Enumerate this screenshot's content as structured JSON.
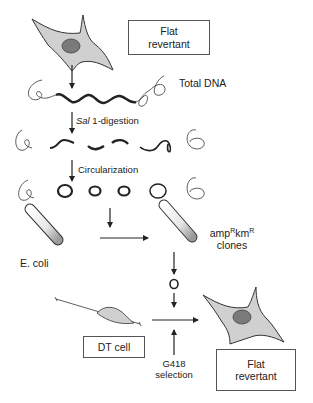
{
  "diagram": {
    "top_box": {
      "line1": "Flat",
      "line2": "revertant"
    },
    "labels": {
      "total_dna": "Total DNA",
      "digestion_enzyme": "Sal",
      "digestion_suffix": " 1-digestion",
      "circularization": "Circularization",
      "ecoli": "E. coli",
      "clones_amp": "amp",
      "clones_r1": "R",
      "clones_km": "km",
      "clones_r2": "R",
      "clones_line2": "clones",
      "selection_line1": "G418",
      "selection_line2": "selection"
    },
    "dt_box": {
      "label": "DT cell"
    },
    "bottom_box": {
      "line1": "Flat",
      "line2": "revertant"
    },
    "colors": {
      "cell_fill": "#d0d0d0",
      "nucleus_fill": "#7a7a7a",
      "stroke": "#333333"
    }
  }
}
